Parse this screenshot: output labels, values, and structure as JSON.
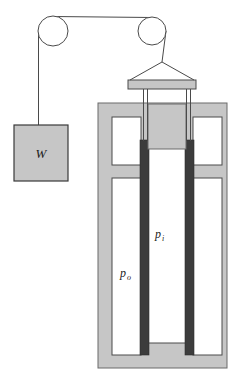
{
  "figure": {
    "type": "engineering-schematic"
  },
  "labels": {
    "weight": "W",
    "inner_pressure": "p",
    "inner_pressure_sub": "i",
    "outer_pressure": "p",
    "outer_pressure_sub": "o"
  },
  "colors": {
    "background": "#ffffff",
    "body_fill": "#c6c6c6",
    "body_stroke": "#555555",
    "cylinder_dark": "#3c3c3c",
    "cavity_fill": "#ffffff",
    "line": "#4a4a4a",
    "text": "#1a1a1a"
  },
  "parts": {
    "pulley_left": "pulley-left",
    "pulley_right": "pulley-right",
    "cable": "cable",
    "weight_block": "weight-block",
    "yoke": "yoke-sling",
    "crossbar": "crossbar",
    "rod_left": "piston-rod-left",
    "rod_right": "piston-rod-right",
    "vessel": "pressure-vessel",
    "piston": "piston-head",
    "inner_wall_left": "inner-cylinder-wall-left",
    "inner_wall_right": "inner-cylinder-wall-right"
  },
  "geometry": {
    "width": 242,
    "height": 383,
    "pulley_left_cx": 53,
    "pulley_left_cy": 31,
    "pulley_left_r": 15,
    "pulley_right_cx": 152,
    "pulley_right_cy": 31,
    "pulley_right_r": 14,
    "weight_x": 14,
    "weight_y": 125,
    "weight_w": 54,
    "weight_h": 56,
    "crossbar_x": 128,
    "crossbar_y": 80,
    "crossbar_w": 68,
    "crossbar_h": 9,
    "vessel_x": 98,
    "vessel_y": 103,
    "vessel_w": 129,
    "vessel_h": 265
  }
}
